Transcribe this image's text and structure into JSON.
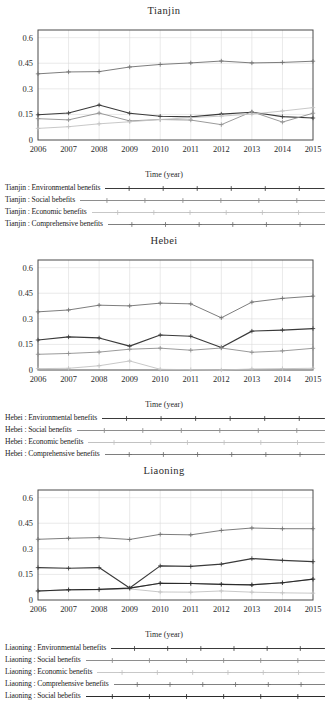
{
  "figure": {
    "panels": [
      "tianjin",
      "hebei",
      "liaoning"
    ],
    "xlabel": "Time (year)",
    "series_colors": {
      "environmental": "#3a3a3a",
      "social": "#8e8e8e",
      "economic": "#c2c2c2",
      "comprehensive": "#6e6e6e",
      "social_dup": "#2b2b2b"
    }
  },
  "panel_tianjin": {
    "title": "Tianjin",
    "xlabel": "Time (year)",
    "legend": [
      "Tianjin : Environmental benefits",
      "Tianjin : Social bebefits",
      "Tianjin : Economic benefits",
      "Tianjin : Comprehensive benefits"
    ]
  },
  "panel_hebei": {
    "title": "Hebei",
    "xlabel": "Time (year)",
    "legend": [
      "Hebei : Environmental benefits",
      "Hebei : Social benefits",
      "Hebei : Economic benefits",
      "Hebei : Comprehensive benefits"
    ]
  },
  "panel_liaoning": {
    "title": "Liaoning",
    "xlabel": "Time (year)",
    "legend": [
      "Liaoning : Environmental benefits",
      "Liaoning : Social benefits",
      "Liaoning : Economic benefits",
      "Liaoning : Comprehensive benefits",
      "Liaoning : Social bebefits"
    ]
  },
  "chart_data": [
    {
      "type": "line",
      "title": "Tianjin",
      "xlabel": "Time (year)",
      "ylabel": "",
      "categories": [
        2006,
        2007,
        2008,
        2009,
        2010,
        2011,
        2012,
        2013,
        2014,
        2015
      ],
      "xticklabels": [
        "2006",
        "2007",
        "2008",
        "2009",
        "2010",
        "2011",
        "2012",
        "2013",
        "2014",
        "2015"
      ],
      "yticks": [
        0,
        0.15,
        0.3,
        0.45,
        0.6
      ],
      "yticklabels": [
        "0",
        "0.15",
        "0.3",
        "0.45",
        "0.6"
      ],
      "ylim": [
        0,
        0.645
      ],
      "grid": true,
      "legend_position": "below",
      "series": [
        {
          "name": "Tianjin : Environmental benefits",
          "color": "#3a3a3a",
          "marker": "plus",
          "values": [
            0.148,
            0.158,
            0.205,
            0.157,
            0.139,
            0.136,
            0.152,
            0.163,
            0.137,
            0.129
          ]
        },
        {
          "name": "Tianjin : Social bebefits",
          "color": "#8e8e8e",
          "marker": "plus",
          "values": [
            0.125,
            0.118,
            0.158,
            0.112,
            0.12,
            0.117,
            0.09,
            0.166,
            0.105,
            0.157
          ]
        },
        {
          "name": "Tianjin : Economic benefits",
          "color": "#c2c2c2",
          "marker": "plus",
          "values": [
            0.068,
            0.078,
            0.095,
            0.107,
            0.12,
            0.131,
            0.14,
            0.152,
            0.17,
            0.19
          ]
        },
        {
          "name": "Tianjin : Comprehensive benefits",
          "color": "#6e6e6e",
          "marker": "plus",
          "values": [
            0.388,
            0.399,
            0.401,
            0.428,
            0.443,
            0.452,
            0.463,
            0.452,
            0.455,
            0.462
          ]
        }
      ]
    },
    {
      "type": "line",
      "title": "Hebei",
      "xlabel": "Time (year)",
      "ylabel": "",
      "categories": [
        2006,
        2007,
        2008,
        2009,
        2010,
        2011,
        2012,
        2013,
        2014,
        2015
      ],
      "xticklabels": [
        "2006",
        "2007",
        "2008",
        "2009",
        "2010",
        "2011",
        "2012",
        "2013",
        "2014",
        "2015"
      ],
      "yticks": [
        0,
        0.15,
        0.3,
        0.45,
        0.6
      ],
      "yticklabels": [
        "0",
        "0.15",
        "0.3",
        "0.45",
        "0.6"
      ],
      "ylim": [
        0,
        0.645
      ],
      "grid": true,
      "legend_position": "below",
      "series": [
        {
          "name": "Hebei : Environmental benefits",
          "color": "#3a3a3a",
          "marker": "plus",
          "values": [
            0.176,
            0.194,
            0.188,
            0.14,
            0.205,
            0.198,
            0.132,
            0.228,
            0.234,
            0.243
          ]
        },
        {
          "name": "Hebei : Social benefits",
          "color": "#8e8e8e",
          "marker": "plus",
          "values": [
            0.092,
            0.097,
            0.105,
            0.122,
            0.128,
            0.116,
            0.129,
            0.104,
            0.112,
            0.127
          ]
        },
        {
          "name": "Hebei : Economic benefits",
          "color": "#c2c2c2",
          "marker": "plus",
          "values": [
            0.008,
            0.01,
            0.025,
            0.053,
            0.004,
            0.002,
            0.0,
            0.006,
            0.008,
            0.01
          ]
        },
        {
          "name": "Hebei : Comprehensive benefits",
          "color": "#6e6e6e",
          "marker": "plus",
          "values": [
            0.341,
            0.352,
            0.38,
            0.376,
            0.392,
            0.388,
            0.306,
            0.398,
            0.42,
            0.433
          ]
        }
      ]
    },
    {
      "type": "line",
      "title": "Liaoning",
      "xlabel": "Time (year)",
      "ylabel": "",
      "categories": [
        2006,
        2007,
        2008,
        2009,
        2010,
        2011,
        2012,
        2013,
        2014,
        2015
      ],
      "xticklabels": [
        "2006",
        "2007",
        "2008",
        "2009",
        "2010",
        "2011",
        "2012",
        "2013",
        "2014",
        "2015"
      ],
      "yticks": [
        0,
        0.15,
        0.3,
        0.45,
        0.6
      ],
      "yticklabels": [
        "0",
        "0.15",
        "0.3",
        "0.45",
        "0.6"
      ],
      "ylim": [
        0,
        0.645
      ],
      "grid": true,
      "legend_position": "below",
      "series": [
        {
          "name": "Liaoning : Environmental benefits",
          "color": "#3a3a3a",
          "marker": "plus",
          "values": [
            0.19,
            0.186,
            0.19,
            0.07,
            0.2,
            0.197,
            0.21,
            0.243,
            0.232,
            0.225
          ]
        },
        {
          "name": "Liaoning : Social benefits",
          "color": "#8e8e8e",
          "marker": "plus",
          "values": [
            0.053,
            0.06,
            0.062,
            0.07,
            0.098,
            0.097,
            0.092,
            0.089,
            0.101,
            0.122
          ]
        },
        {
          "name": "Liaoning : Economic benefits",
          "color": "#c2c2c2",
          "marker": "plus",
          "values": [
            0.053,
            0.057,
            0.06,
            0.065,
            0.047,
            0.046,
            0.053,
            0.046,
            0.042,
            0.04
          ]
        },
        {
          "name": "Liaoning : Comprehensive benefits",
          "color": "#6e6e6e",
          "marker": "plus",
          "values": [
            0.356,
            0.362,
            0.366,
            0.355,
            0.385,
            0.382,
            0.408,
            0.422,
            0.418,
            0.418
          ]
        },
        {
          "name": "Liaoning : Social bebefits",
          "color": "#2b2b2b",
          "marker": "plus",
          "values": [
            0.053,
            0.06,
            0.062,
            0.07,
            0.098,
            0.097,
            0.092,
            0.089,
            0.101,
            0.122
          ]
        }
      ]
    }
  ]
}
